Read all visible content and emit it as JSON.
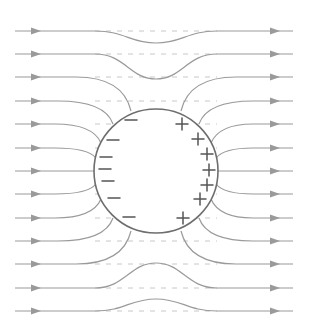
{
  "diagram": {
    "colors": {
      "field_line": "#9a9a9a",
      "guide_line": "#c8c8c8",
      "conductor": "#6e6e6e",
      "charge": "#555555",
      "background": "#ffffff"
    },
    "conductor": {
      "cx": 156,
      "cy": 171,
      "r": 62
    },
    "field_direction": "left-to-right",
    "field_lines": [
      {
        "y": 31,
        "type": "deflect",
        "dip": 43
      },
      {
        "y": 54,
        "type": "deflect",
        "dip": 79
      },
      {
        "y": 77,
        "type": "terminate",
        "entry": [
          131,
          111
        ],
        "exit": [
          181,
          111
        ]
      },
      {
        "y": 101,
        "type": "terminate",
        "entry": [
          113,
          124
        ],
        "exit": [
          199,
          124
        ]
      },
      {
        "y": 124,
        "type": "terminate",
        "entry": [
          101,
          143
        ],
        "exit": [
          211,
          143
        ]
      },
      {
        "y": 148,
        "type": "terminate",
        "entry": [
          96,
          158
        ],
        "exit": [
          216,
          158
        ]
      },
      {
        "y": 171,
        "type": "terminate",
        "entry": [
          94,
          171
        ],
        "exit": [
          218,
          171
        ]
      },
      {
        "y": 194,
        "type": "terminate",
        "entry": [
          96,
          184
        ],
        "exit": [
          216,
          184
        ]
      },
      {
        "y": 218,
        "type": "terminate",
        "entry": [
          101,
          199
        ],
        "exit": [
          211,
          199
        ]
      },
      {
        "y": 241,
        "type": "terminate",
        "entry": [
          113,
          218
        ],
        "exit": [
          199,
          218
        ]
      },
      {
        "y": 264,
        "type": "terminate",
        "entry": [
          131,
          231
        ],
        "exit": [
          181,
          231
        ]
      },
      {
        "y": 288,
        "type": "deflect",
        "dip": 263
      },
      {
        "y": 311,
        "type": "deflect",
        "dip": 299
      }
    ],
    "charges": {
      "negative": [
        {
          "x": 131,
          "y": 120
        },
        {
          "x": 113,
          "y": 140
        },
        {
          "x": 106,
          "y": 157
        },
        {
          "x": 105,
          "y": 169
        },
        {
          "x": 108,
          "y": 181
        },
        {
          "x": 114,
          "y": 198
        },
        {
          "x": 129,
          "y": 217
        }
      ],
      "positive": [
        {
          "x": 182,
          "y": 124
        },
        {
          "x": 198,
          "y": 139
        },
        {
          "x": 207,
          "y": 154
        },
        {
          "x": 209,
          "y": 170
        },
        {
          "x": 207,
          "y": 185
        },
        {
          "x": 200,
          "y": 199
        },
        {
          "x": 183,
          "y": 218
        }
      ],
      "negative_symbol": "−",
      "positive_symbol": "+"
    },
    "arrow_positions": {
      "left_x": 36,
      "right_x": 275
    },
    "x_range": [
      15,
      293
    ]
  }
}
